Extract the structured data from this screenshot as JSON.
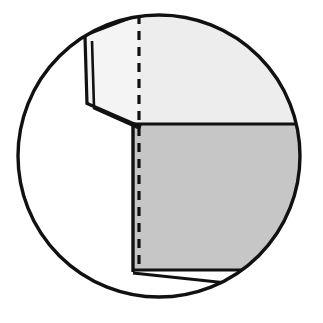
{
  "figure": {
    "kind": "technical-line-drawing",
    "canvas": {
      "width": 323,
      "height": 323,
      "background": "#ffffff"
    },
    "colors": {
      "outline": "#111111",
      "top_panel_fill": "#ededed",
      "front_panel_fill": "#c6c6c6",
      "flap_fill": "#f4f4f4",
      "bottom_strip_fill": "#ffffff",
      "background": "#ffffff"
    },
    "detail_circle": {
      "label": "detail-boundary-circle",
      "center_x": 159,
      "center_y": 156,
      "radius": 143,
      "stroke_width": 3.4
    },
    "top_panel": {
      "label": "upper-light-panel",
      "points": "86,38 88,103 133,124 301,124 301,30 138,15"
    },
    "front_panel": {
      "label": "front-gray-panel",
      "points": "133,124 301,124 301,270 133,270"
    },
    "left_flap": {
      "label": "left-folded-flap",
      "outer": "84,36 86,103 140,124 138,15",
      "fold_line_a": "86,38 88,103",
      "fold_line_b": "91,41 93,106",
      "hem_line": "88,103 141,127",
      "hem_line_2": "93,107 144,131"
    },
    "bottom_strip": {
      "label": "bottom-return-strip",
      "points": "133,270 301,270 252,290 133,274"
    },
    "centerline": {
      "label": "dashed-centerline",
      "x": 139,
      "y_top": 15,
      "y_bottom": 271,
      "dash": "9 7",
      "stroke_width": 3.2
    },
    "edges": {
      "top_horizontal_label": "panel-split-line",
      "left_vertical_label": "panel-left-edge",
      "bottom_horizontal_label": "panel-bottom-edge"
    }
  }
}
